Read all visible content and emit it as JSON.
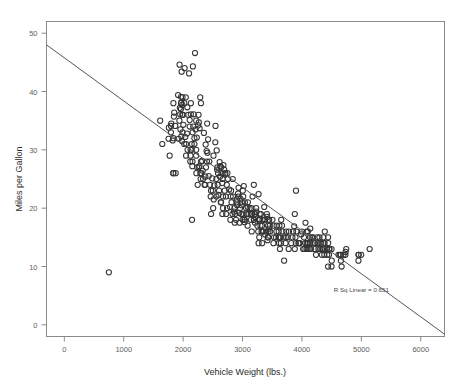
{
  "chart_data": {
    "type": "scatter",
    "title": "",
    "xlabel": "Vehicle Weight (lbs.)",
    "ylabel": "Miles per Gallon",
    "xlim": [
      -300,
      6400
    ],
    "ylim": [
      -2,
      52
    ],
    "xticks": [
      0,
      1000,
      2000,
      3000,
      4000,
      5000,
      6000
    ],
    "xtick_labels": [
      "0",
      "1000",
      "2000",
      "3000",
      "4000",
      "5000",
      "6000"
    ],
    "yticks": [
      0,
      10,
      20,
      30,
      40,
      50
    ],
    "ytick_labels": [
      "0",
      "10",
      "20",
      "30",
      "40",
      "50"
    ],
    "grid": false,
    "legend": null,
    "annotations": [
      {
        "text": "R Sq Linear = 0.651",
        "x": 5000,
        "y": 5.6
      }
    ],
    "fit_line": {
      "type": "linear",
      "r_squared": 0.651,
      "intercept": 46.9,
      "slope": -0.0076,
      "x_start": -300,
      "y_start": 48.0,
      "x_end": 6400,
      "y_end": -1.6
    },
    "marker": {
      "shape": "open-circle",
      "radius_px": 2.6,
      "color": "#343434"
    },
    "points": [
      [
        1613,
        35.0
      ],
      [
        1649,
        31.0
      ],
      [
        1755,
        31.9
      ],
      [
        1760,
        33.8
      ],
      [
        1773,
        29.0
      ],
      [
        1795,
        33.0
      ],
      [
        1795,
        34.1
      ],
      [
        1800,
        34.5
      ],
      [
        1825,
        31.6
      ],
      [
        1834,
        26.0
      ],
      [
        1835,
        26.0
      ],
      [
        1835,
        32.0
      ],
      [
        1836,
        38.0
      ],
      [
        1845,
        35.7
      ],
      [
        1850,
        36.4
      ],
      [
        1867,
        34.1
      ],
      [
        1875,
        26.0
      ],
      [
        1915,
        39.4
      ],
      [
        1925,
        31.9
      ],
      [
        1937,
        35.0
      ],
      [
        1940,
        44.6
      ],
      [
        1945,
        37.2
      ],
      [
        1950,
        36.1
      ],
      [
        1955,
        33.5
      ],
      [
        1963,
        37.0
      ],
      [
        1965,
        38.0
      ],
      [
        1965,
        39.1
      ],
      [
        1968,
        38.1
      ],
      [
        1970,
        32.3
      ],
      [
        1975,
        43.4
      ],
      [
        1980,
        31.5
      ],
      [
        1985,
        37.7
      ],
      [
        1985,
        36.0
      ],
      [
        1990,
        33.0
      ],
      [
        1990,
        39.0
      ],
      [
        2000,
        36.0
      ],
      [
        2003,
        34.3
      ],
      [
        2019,
        31.0
      ],
      [
        2020,
        38.0
      ],
      [
        2025,
        44.0
      ],
      [
        2035,
        32.2
      ],
      [
        2045,
        39.0
      ],
      [
        2050,
        29.0
      ],
      [
        2051,
        31.0
      ],
      [
        2065,
        32.8
      ],
      [
        2070,
        37.3
      ],
      [
        2075,
        30.0
      ],
      [
        2085,
        36.0
      ],
      [
        2100,
        43.1
      ],
      [
        2110,
        34.0
      ],
      [
        2110,
        35.1
      ],
      [
        2120,
        28.0
      ],
      [
        2124,
        29.0
      ],
      [
        2125,
        30.0
      ],
      [
        2130,
        36.1
      ],
      [
        2130,
        38.0
      ],
      [
        2144,
        30.0
      ],
      [
        2145,
        31.0
      ],
      [
        2155,
        27.2
      ],
      [
        2158,
        28.0
      ],
      [
        2160,
        33.0
      ],
      [
        2164,
        44.3
      ],
      [
        2171,
        34.0
      ],
      [
        2178,
        36.1
      ],
      [
        2190,
        31.0
      ],
      [
        2190,
        32.0
      ],
      [
        2200,
        46.6
      ],
      [
        2210,
        33.5
      ],
      [
        2219,
        29.0
      ],
      [
        2220,
        30.0
      ],
      [
        2223,
        26.0
      ],
      [
        2230,
        32.1
      ],
      [
        2234,
        27.0
      ],
      [
        2245,
        24.0
      ],
      [
        2254,
        34.2
      ],
      [
        2264,
        27.0
      ],
      [
        2265,
        34.7
      ],
      [
        2275,
        27.2
      ],
      [
        2278,
        33.7
      ],
      [
        2288,
        39.0
      ],
      [
        2290,
        26.0
      ],
      [
        2295,
        25.0
      ],
      [
        2300,
        28.0
      ],
      [
        2300,
        38.0
      ],
      [
        2310,
        26.0
      ],
      [
        2320,
        28.1
      ],
      [
        2330,
        26.4
      ],
      [
        2335,
        25.0
      ],
      [
        2350,
        32.9
      ],
      [
        2360,
        24.0
      ],
      [
        2372,
        24.0
      ],
      [
        2375,
        25.4
      ],
      [
        2379,
        30.9
      ],
      [
        2385,
        27.0
      ],
      [
        2395,
        29.8
      ],
      [
        2401,
        28.0
      ],
      [
        2405,
        34.5
      ],
      [
        2408,
        29.5
      ],
      [
        2420,
        31.8
      ],
      [
        2430,
        25.5
      ],
      [
        2440,
        28.0
      ],
      [
        2451,
        24.0
      ],
      [
        2464,
        22.0
      ],
      [
        2470,
        23.0
      ],
      [
        2490,
        25.1
      ],
      [
        2500,
        23.0
      ],
      [
        2506,
        20.0
      ],
      [
        2511,
        29.0
      ],
      [
        2515,
        21.5
      ],
      [
        2525,
        23.9
      ],
      [
        2542,
        31.3
      ],
      [
        2545,
        34.1
      ],
      [
        2560,
        25.0
      ],
      [
        2565,
        29.9
      ],
      [
        2572,
        26.6
      ],
      [
        2575,
        27.0
      ],
      [
        2582,
        24.0
      ],
      [
        2587,
        26.0
      ],
      [
        2595,
        22.3
      ],
      [
        2605,
        23.0
      ],
      [
        2615,
        27.9
      ],
      [
        2620,
        25.4
      ],
      [
        2625,
        27.2
      ],
      [
        2634,
        21.0
      ],
      [
        2639,
        21.0
      ],
      [
        2640,
        27.0
      ],
      [
        2648,
        26.0
      ],
      [
        2660,
        24.3
      ],
      [
        2665,
        25.0
      ],
      [
        2671,
        22.0
      ],
      [
        2672,
        20.0
      ],
      [
        2678,
        27.4
      ],
      [
        2690,
        26.6
      ],
      [
        2700,
        23.0
      ],
      [
        2702,
        25.8
      ],
      [
        2711,
        26.0
      ],
      [
        2720,
        22.0
      ],
      [
        2725,
        19.0
      ],
      [
        2735,
        24.0
      ],
      [
        2740,
        20.0
      ],
      [
        2745,
        26.0
      ],
      [
        2755,
        25.0
      ],
      [
        2775,
        23.2
      ],
      [
        2789,
        20.2
      ],
      [
        2795,
        18.0
      ],
      [
        2800,
        22.0
      ],
      [
        2807,
        23.0
      ],
      [
        2815,
        21.0
      ],
      [
        2830,
        19.0
      ],
      [
        2835,
        25.0
      ],
      [
        2840,
        22.0
      ],
      [
        2855,
        19.4
      ],
      [
        2865,
        20.0
      ],
      [
        2868,
        17.5
      ],
      [
        2875,
        19.0
      ],
      [
        2890,
        18.0
      ],
      [
        2900,
        21.0
      ],
      [
        2904,
        21.5
      ],
      [
        2910,
        20.5
      ],
      [
        2930,
        22.0
      ],
      [
        2933,
        23.5
      ],
      [
        2945,
        19.2
      ],
      [
        2950,
        17.5
      ],
      [
        2957,
        20.0
      ],
      [
        2965,
        21.6
      ],
      [
        2979,
        19.0
      ],
      [
        2984,
        20.5
      ],
      [
        2990,
        21.0
      ],
      [
        3000,
        18.0
      ],
      [
        3003,
        19.0
      ],
      [
        3005,
        23.0
      ],
      [
        3012,
        22.0
      ],
      [
        3021,
        23.8
      ],
      [
        3035,
        17.6
      ],
      [
        3039,
        18.0
      ],
      [
        3040,
        21.0
      ],
      [
        3060,
        20.0
      ],
      [
        3070,
        19.0
      ],
      [
        3085,
        20.2
      ],
      [
        3086,
        17.0
      ],
      [
        3090,
        21.0
      ],
      [
        3102,
        19.0
      ],
      [
        3120,
        20.0
      ],
      [
        3139,
        19.0
      ],
      [
        3140,
        18.0
      ],
      [
        3150,
        20.0
      ],
      [
        3155,
        16.0
      ],
      [
        3158,
        19.0
      ],
      [
        3169,
        22.0
      ],
      [
        3190,
        18.0
      ],
      [
        3190,
        24.0
      ],
      [
        3193,
        18.0
      ],
      [
        3205,
        19.0
      ],
      [
        3210,
        17.5
      ],
      [
        3211,
        19.0
      ],
      [
        3221,
        18.5
      ],
      [
        3230,
        20.0
      ],
      [
        3233,
        19.4
      ],
      [
        3250,
        17.0
      ],
      [
        3264,
        16.0
      ],
      [
        3270,
        22.4
      ],
      [
        3278,
        18.0
      ],
      [
        3282,
        15.0
      ],
      [
        3288,
        19.0
      ],
      [
        3290,
        18.1
      ],
      [
        3302,
        17.0
      ],
      [
        3310,
        19.0
      ],
      [
        3320,
        16.0
      ],
      [
        3329,
        17.0
      ],
      [
        3336,
        16.0
      ],
      [
        3336,
        18.0
      ],
      [
        3353,
        16.0
      ],
      [
        3360,
        18.0
      ],
      [
        3365,
        20.2
      ],
      [
        3380,
        15.5
      ],
      [
        3381,
        18.0
      ],
      [
        3399,
        16.0
      ],
      [
        3410,
        19.0
      ],
      [
        3415,
        18.5
      ],
      [
        3425,
        15.0
      ],
      [
        3430,
        17.0
      ],
      [
        3433,
        15.0
      ],
      [
        3436,
        16.0
      ],
      [
        3439,
        18.0
      ],
      [
        3445,
        16.5
      ],
      [
        3449,
        18.0
      ],
      [
        3459,
        17.0
      ],
      [
        3465,
        16.0
      ],
      [
        3504,
        18.0
      ],
      [
        3520,
        14.0
      ],
      [
        3525,
        17.0
      ],
      [
        3530,
        15.0
      ],
      [
        3563,
        15.0
      ],
      [
        3570,
        16.0
      ],
      [
        3574,
        17.0
      ],
      [
        3605,
        15.0
      ],
      [
        3609,
        16.0
      ],
      [
        3613,
        14.0
      ],
      [
        3620,
        17.0
      ],
      [
        3630,
        13.0
      ],
      [
        3632,
        15.0
      ],
      [
        3645,
        14.0
      ],
      [
        3651,
        18.0
      ],
      [
        3664,
        17.0
      ],
      [
        3672,
        16.0
      ],
      [
        3693,
        15.0
      ],
      [
        3700,
        11.0
      ],
      [
        3725,
        14.0
      ],
      [
        3730,
        15.0
      ],
      [
        3735,
        16.0
      ],
      [
        3761,
        15.0
      ],
      [
        3777,
        13.0
      ],
      [
        3781,
        16.0
      ],
      [
        3820,
        14.0
      ],
      [
        3840,
        15.0
      ],
      [
        3850,
        16.0
      ],
      [
        3870,
        16.9
      ],
      [
        3880,
        13.0
      ],
      [
        3892,
        15.0
      ],
      [
        3897,
        14.0
      ],
      [
        3900,
        23.0
      ],
      [
        3907,
        16.0
      ],
      [
        3940,
        14.0
      ],
      [
        3955,
        14.0
      ],
      [
        3962,
        14.0
      ],
      [
        3988,
        15.5
      ],
      [
        4000,
        16.0
      ],
      [
        4020,
        13.0
      ],
      [
        4035,
        15.0
      ],
      [
        4042,
        13.0
      ],
      [
        4054,
        14.0
      ],
      [
        4060,
        17.5
      ],
      [
        4077,
        13.0
      ],
      [
        4080,
        14.0
      ],
      [
        4082,
        16.0
      ],
      [
        4096,
        13.0
      ],
      [
        4098,
        14.0
      ],
      [
        4100,
        14.0
      ],
      [
        4129,
        13.0
      ],
      [
        4131,
        14.0
      ],
      [
        4135,
        15.0
      ],
      [
        4140,
        16.5
      ],
      [
        4141,
        14.0
      ],
      [
        4154,
        13.0
      ],
      [
        4165,
        15.0
      ],
      [
        4190,
        15.0
      ],
      [
        4209,
        14.0
      ],
      [
        4215,
        13.0
      ],
      [
        4220,
        14.0
      ],
      [
        4237,
        12.0
      ],
      [
        4257,
        15.0
      ],
      [
        4274,
        14.0
      ],
      [
        4278,
        13.0
      ],
      [
        4295,
        15.0
      ],
      [
        4312,
        13.0
      ],
      [
        4325,
        14.0
      ],
      [
        4335,
        12.0
      ],
      [
        4341,
        13.0
      ],
      [
        4354,
        13.0
      ],
      [
        4360,
        15.0
      ],
      [
        4363,
        14.0
      ],
      [
        4376,
        12.0
      ],
      [
        4380,
        13.0
      ],
      [
        4382,
        14.0
      ],
      [
        4385,
        16.0
      ],
      [
        4422,
        13.0
      ],
      [
        4425,
        12.0
      ],
      [
        4440,
        10.0
      ],
      [
        4441,
        14.0
      ],
      [
        4456,
        12.0
      ],
      [
        4457,
        13.0
      ],
      [
        4464,
        13.0
      ],
      [
        4498,
        10.0
      ],
      [
        4499,
        13.0
      ],
      [
        4502,
        11.0
      ],
      [
        4615,
        12.0
      ],
      [
        4638,
        12.0
      ],
      [
        4654,
        12.0
      ],
      [
        4657,
        11.0
      ],
      [
        4668,
        10.0
      ],
      [
        4699,
        12.0
      ],
      [
        4732,
        12.0
      ],
      [
        4735,
        12.5
      ],
      [
        4746,
        13.0
      ],
      [
        4951,
        11.0
      ],
      [
        4952,
        12.0
      ],
      [
        4955,
        12.0
      ],
      [
        4997,
        12.0
      ],
      [
        5140,
        13.0
      ],
      [
        750,
        9.0
      ],
      [
        2150,
        18.0
      ],
      [
        2220,
        35.0
      ],
      [
        2260,
        36.0
      ],
      [
        2470,
        19.0
      ],
      [
        2560,
        22.0
      ],
      [
        2660,
        19.0
      ],
      [
        2925,
        22.5
      ],
      [
        3030,
        18.0
      ],
      [
        3270,
        14.0
      ],
      [
        3330,
        14.0
      ],
      [
        3420,
        14.5
      ],
      [
        3880,
        19.0
      ],
      [
        4100,
        16.0
      ],
      [
        4260,
        14.0
      ],
      [
        4440,
        15.0
      ]
    ]
  }
}
